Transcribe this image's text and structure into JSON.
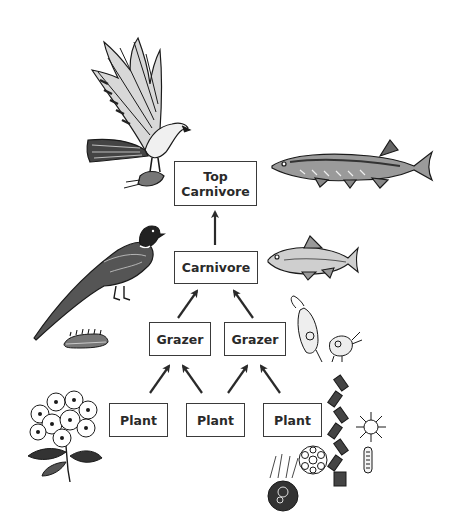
{
  "diagram": {
    "type": "food-chain",
    "colors": {
      "line": "#2a2a2a",
      "box_border": "#3a3a3a",
      "background": "#ffffff",
      "text": "#2a2a2a"
    },
    "nodes": {
      "top_carnivore": {
        "label": "Top\nCarnivore"
      },
      "carnivore": {
        "label": "Carnivore"
      },
      "grazer_left": {
        "label": "Grazer"
      },
      "grazer_right": {
        "label": "Grazer"
      },
      "plant_left": {
        "label": "Plant"
      },
      "plant_middle": {
        "label": "Plant"
      },
      "plant_right": {
        "label": "Plant"
      }
    },
    "edges": [
      {
        "from": "plant_left",
        "to": "grazer_left"
      },
      {
        "from": "plant_middle",
        "to": "grazer_left"
      },
      {
        "from": "plant_middle",
        "to": "grazer_right"
      },
      {
        "from": "plant_right",
        "to": "grazer_right"
      },
      {
        "from": "grazer_left",
        "to": "carnivore"
      },
      {
        "from": "grazer_right",
        "to": "carnivore"
      },
      {
        "from": "carnivore",
        "to": "top_carnivore"
      }
    ],
    "illustrations": [
      {
        "name": "hawk-illustration",
        "level": "top_carnivore"
      },
      {
        "name": "pike-fish-illustration",
        "level": "top_carnivore"
      },
      {
        "name": "pheasant-illustration",
        "level": "carnivore"
      },
      {
        "name": "minnow-fish-illustration",
        "level": "carnivore"
      },
      {
        "name": "caterpillar-illustration",
        "level": "grazer"
      },
      {
        "name": "zooplankton-illustration",
        "level": "grazer"
      },
      {
        "name": "flowering-plant-illustration",
        "level": "plant"
      },
      {
        "name": "phytoplankton-illustration",
        "level": "plant"
      }
    ]
  }
}
